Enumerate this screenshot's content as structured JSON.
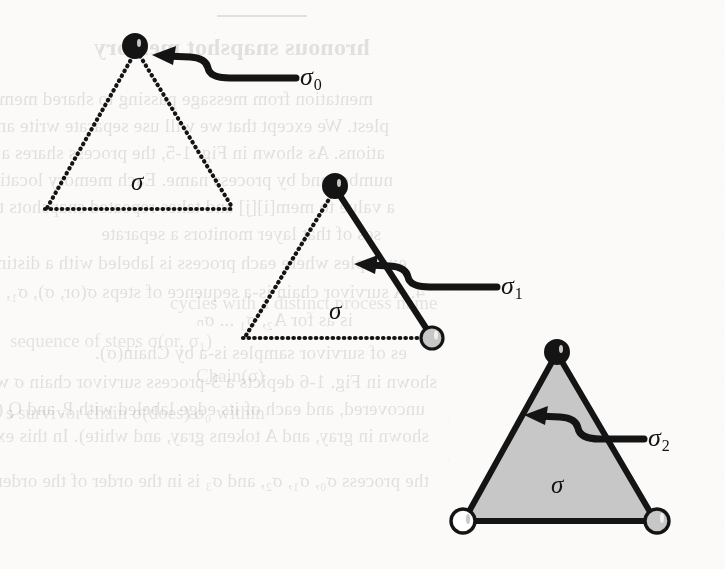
{
  "page": {
    "width": 725,
    "height": 569,
    "background_color": "#fbfaf8",
    "kind": "scanned-book-figure"
  },
  "figure": {
    "ink_color": "#141414",
    "fill_gray": "#c7c7c7",
    "fill_white": "#ffffff",
    "stages": [
      {
        "id": "stage-0",
        "arrow_label": "σ",
        "arrow_label_sub": "0",
        "inner_label": "σ",
        "apex": {
          "x": 135,
          "y": 46,
          "node": "filled-black"
        },
        "bottom_left": {
          "x": 45,
          "y": 209,
          "node": "none"
        },
        "bottom_right": {
          "x": 233,
          "y": 209,
          "node": "none"
        },
        "edges": {
          "left": "dotted",
          "right": "dotted",
          "bottom": "dotted"
        },
        "interior": "empty"
      },
      {
        "id": "stage-1",
        "arrow_label": "σ",
        "arrow_label_sub": "1",
        "inner_label": "σ",
        "apex": {
          "x": 335,
          "y": 186,
          "node": "filled-black"
        },
        "bottom_left": {
          "x": 243,
          "y": 338,
          "node": "none"
        },
        "bottom_right": {
          "x": 431,
          "y": 338,
          "node": "filled-gray"
        },
        "edges": {
          "left": "dotted",
          "right": "solid",
          "bottom": "dotted"
        },
        "interior": "empty"
      },
      {
        "id": "stage-2",
        "arrow_label": "σ",
        "arrow_label_sub": "2",
        "inner_label": "σ",
        "apex": {
          "x": 557,
          "y": 352,
          "node": "filled-black"
        },
        "bottom_left": {
          "x": 463,
          "y": 521,
          "node": "filled-white"
        },
        "bottom_right": {
          "x": 657,
          "y": 521,
          "node": "filled-gray"
        },
        "edges": {
          "left": "solid",
          "right": "solid",
          "bottom": "solid"
        },
        "interior": "filled-gray"
      }
    ]
  },
  "bleed_through": {
    "note": "faint mirrored show-through text from the reverse of the scanned page",
    "heading": "hronous snapshot memory",
    "mirrored_lines": [
      {
        "x": 352,
        "y": 88,
        "text": "mentation from message passing to shared memory. This model is"
      },
      {
        "x": 336,
        "y": 115,
        "text": "plest. We except that we will use separate write and snapshot oper-"
      },
      {
        "x": 340,
        "y": 142,
        "text": "ations. As shown in Fig. 1-5, the process shares a two-dimensional"
      },
      {
        "x": 332,
        "y": 169,
        "text": "number and by process name. Each memory location holds a value"
      },
      {
        "x": 330,
        "y": 196,
        "text": "a value to mem[i][j] and takes repeated snapshots to find the val-"
      },
      {
        "x": 344,
        "y": 223,
        "text": "ses of that layer monitors a separate"
      },
      {
        "x": 318,
        "y": 252,
        "text": "examples where each process is labeled with a distinct process name"
      },
      {
        "x": 300,
        "y": 281,
        "text": "4. A survivor chain is-a sequence of steps σ(or, σ), σ₁, ... such"
      },
      {
        "x": 372,
        "y": 308,
        "text": "is as for A₂, σ₁ ... σₙ"
      },
      {
        "x": 318,
        "y": 342,
        "text": "es of survivor samples is-a by Chain(σ)."
      },
      {
        "x": 288,
        "y": 371,
        "text": "shown in Fig. 1-6 depicts a 3-process survivor chain σ within a survivor chain σ₀ of"
      },
      {
        "x": 300,
        "y": 398,
        "text": "uncovered, and each of its edge labeled with P, and Q (black,"
      },
      {
        "x": 296,
        "y": 425,
        "text": "shown in gray, and A tokens gray, and white). In this example,"
      },
      {
        "x": 296,
        "y": 470,
        "text": "the process σ₀, σ₁, σ₂, and σ₃ is in the order of the order of a step"
      }
    ],
    "forward_lines": [
      {
        "x": 170,
        "y": 292,
        "text": "cycles with a distinct process name"
      },
      {
        "x": 10,
        "y": 330,
        "text": "sequence of steps σ(or, σ₁)"
      },
      {
        "x": 196,
        "y": 365,
        "text": "Chain(σ)"
      },
      {
        "x": 6,
        "y": 402,
        "text": "s survivor chain σ(does) σ₀ within"
      }
    ]
  }
}
